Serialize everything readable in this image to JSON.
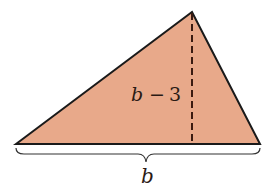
{
  "diagram": {
    "shape": "triangle",
    "fill_color": "#E8A98A",
    "stroke_color": "#1a1a1a",
    "height_label": {
      "var": "b",
      "op": "−",
      "num": "3"
    },
    "base_label": "b"
  }
}
